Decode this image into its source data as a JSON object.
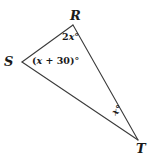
{
  "figure": {
    "type": "triangle-angle-diagram",
    "background_color": "#ffffff",
    "stroke_color": "#3b3b3b",
    "text_color": "#1a1a1a",
    "vertices": [
      {
        "name": "R",
        "label": "R",
        "x": 73,
        "y": 25
      },
      {
        "name": "S",
        "label": "S",
        "x": 22,
        "y": 62
      },
      {
        "name": "T",
        "label": "T",
        "x": 138,
        "y": 140
      }
    ],
    "edges": [
      {
        "name": "edge-SR",
        "from": "S",
        "to": "R"
      },
      {
        "name": "edge-RT",
        "from": "R",
        "to": "T"
      },
      {
        "name": "edge-ST",
        "from": "S",
        "to": "T"
      }
    ],
    "angles": [
      {
        "at": "R",
        "label": "2x°",
        "prefix": "2",
        "variable": "x",
        "suffix": "°"
      },
      {
        "at": "S",
        "label": "(x + 30)°",
        "prefix": "(",
        "variable": "x",
        "suffix": " + 30)°"
      },
      {
        "at": "T",
        "label": "x°",
        "prefix": "",
        "variable": "x",
        "suffix": "°",
        "rotation_deg": -42
      }
    ]
  }
}
